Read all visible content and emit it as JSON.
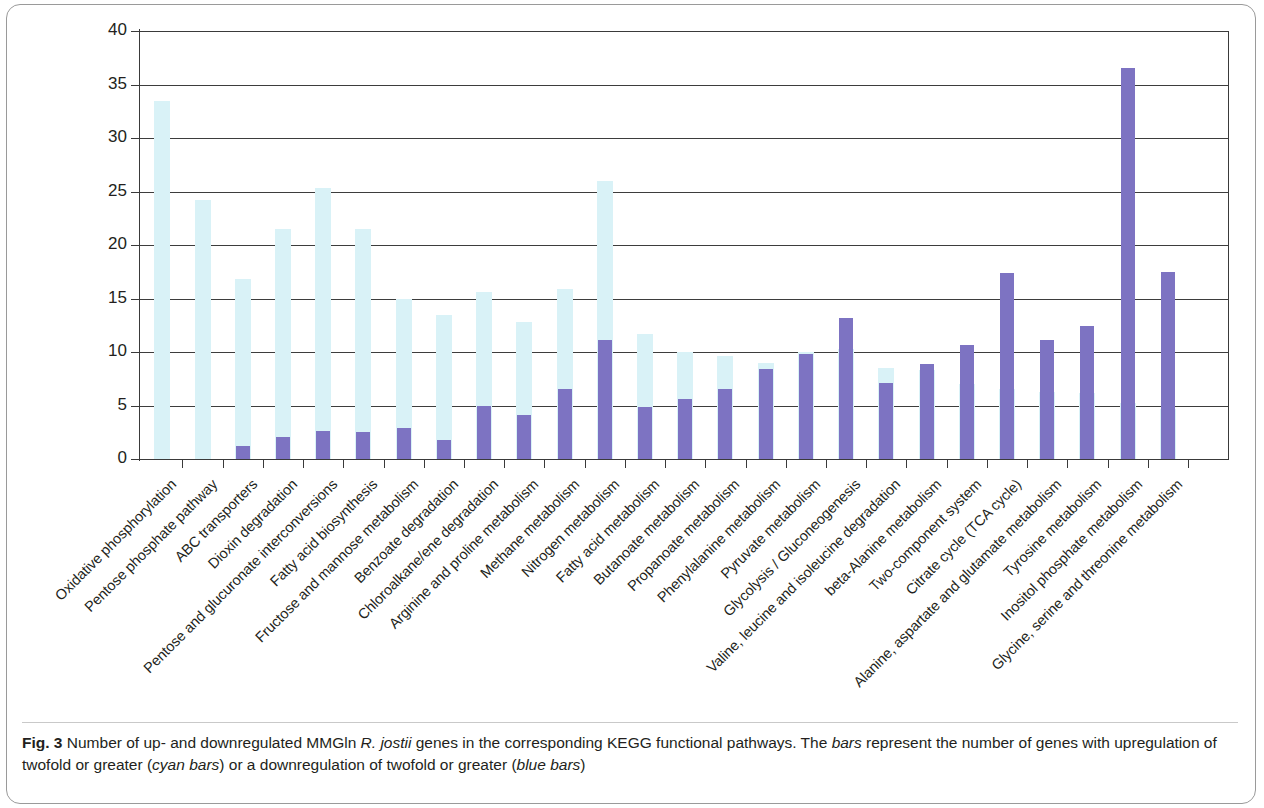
{
  "figure": {
    "label": "Fig. 3",
    "caption_part1": " Number of up- and downregulated MMGln ",
    "caption_italic1": "R. jostii",
    "caption_part2": " genes in the corresponding KEGG functional pathways. The ",
    "caption_italic2": "bars",
    "caption_part3": " represent the number of genes with upregulation of twofold or greater (",
    "caption_italic3": "cyan bars",
    "caption_part4": ") or a downregulation of twofold or greater (",
    "caption_italic4": "blue bars",
    "caption_part5": ")"
  },
  "colors": {
    "cyan_bar": "#d9f2f7",
    "blue_bar": "#7d73c2",
    "axis": "#3a3a3a",
    "grid": "#3d3d3d",
    "text": "#231f20",
    "frame": "#9a9a9a"
  },
  "chart_data": {
    "type": "bar",
    "title": "",
    "xlabel": "",
    "ylabel": "",
    "ylim": [
      0,
      40
    ],
    "yticks": [
      0,
      5,
      10,
      15,
      20,
      25,
      30,
      35,
      40
    ],
    "grid": true,
    "legend": null,
    "categories": [
      "Oxidative phosphorylation",
      "Pentose phosphate pathway",
      "ABC transporters",
      "Dioxin degradation",
      "Pentose and glucuronate interconversions",
      "Fatty acid biosynthesis",
      "Fructose and mannose metabolism",
      "Benzoate degradation",
      "Chloroalkane/ene degradation",
      "Arginine and proline metabolism",
      "Methane metabolism",
      "Nitrogen metabolism",
      "Fatty acid metabolism",
      "Butanoate metabolism",
      "Propanoate metabolism",
      "Phenylalanine metabolism",
      "Pyruvate metabolism",
      "Glycolysis / Gluconeogenesis",
      "Valine, leucine and isoleucine degradation",
      "beta-Alanine metabolism",
      "Two-component system",
      "Citrate cycle (TCA cycle)",
      "Alanine, aspartate and glutamate metabolism",
      "Tyrosine metabolism",
      "Inositol phosphate metabolism",
      "Glycine, serine and threonine metabolism"
    ],
    "series": [
      {
        "name": "cyan bars",
        "description": "upregulation of twofold or greater",
        "color": "#d9f2f7",
        "values": [
          33.5,
          24.2,
          16.8,
          21.5,
          25.3,
          21.5,
          15.0,
          13.5,
          15.6,
          12.8,
          15.9,
          26.0,
          11.7,
          10.0,
          9.6,
          9.0,
          10.0,
          10.3,
          8.5,
          8.3,
          7.0,
          6.5,
          6.3,
          6.2,
          5.2,
          4.7
        ]
      },
      {
        "name": "blue bars",
        "description": "downregulation of twofold or greater",
        "color": "#7d73c2",
        "values": [
          0,
          0,
          1.2,
          2.1,
          2.6,
          2.5,
          2.9,
          1.8,
          5.0,
          4.1,
          6.5,
          11.1,
          4.9,
          5.6,
          6.5,
          8.4,
          9.8,
          13.2,
          7.1,
          8.9,
          10.7,
          17.4,
          11.1,
          12.4,
          36.5,
          17.5
        ]
      }
    ]
  }
}
